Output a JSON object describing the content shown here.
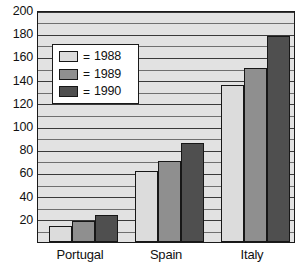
{
  "chart_data": {
    "type": "bar",
    "title": "",
    "xlabel": "",
    "ylabel": "",
    "categories": [
      "Portugal",
      "Spain",
      "Italy"
    ],
    "series": [
      {
        "name": "1988",
        "color": "#dcdcdc",
        "values": [
          14,
          61,
          135
        ]
      },
      {
        "name": "1989",
        "color": "#8f8f8f",
        "values": [
          18,
          70,
          150
        ]
      },
      {
        "name": "1990",
        "color": "#4f4f4f",
        "values": [
          23,
          85,
          178
        ]
      }
    ],
    "ylim": [
      0,
      200
    ],
    "ytick_labels": [
      "200",
      "180",
      "160",
      "140",
      "120",
      "100",
      "80",
      "60",
      "40",
      "20"
    ],
    "ytick_values": [
      200,
      180,
      160,
      140,
      120,
      100,
      80,
      60,
      40,
      20
    ],
    "gridline_values": [
      200,
      190,
      180,
      170,
      160,
      150,
      140,
      130,
      120,
      110,
      100,
      90,
      80,
      70,
      60,
      50,
      40,
      30,
      20,
      10
    ],
    "grid": true,
    "legend_position": "upper-left-inside",
    "legend_entries": [
      {
        "label": "1988",
        "separator": "=",
        "color": "#dcdcdc"
      },
      {
        "label": "1989",
        "separator": "=",
        "color": "#8f8f8f"
      },
      {
        "label": "1990",
        "separator": "=",
        "color": "#4f4f4f"
      }
    ]
  },
  "colors": {
    "plot_background": "#e2e2e2",
    "axis": "#1a1a1a",
    "gridline": "#6f6f6f",
    "text": "#111111",
    "page_background": "#ffffff"
  }
}
